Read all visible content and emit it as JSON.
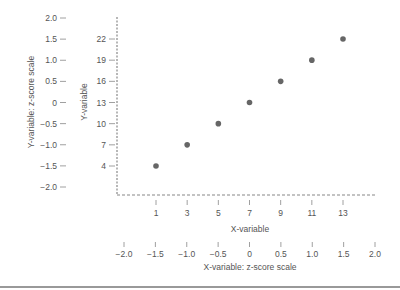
{
  "chart_data": {
    "type": "scatter",
    "title": "",
    "xlabel": "X-variable",
    "ylabel": "Y-variable",
    "secondary_xlabel": "X-variable: z-score scale",
    "secondary_ylabel": "Y-variable: z-score scale",
    "x": [
      1,
      3,
      5,
      7,
      9,
      11,
      13
    ],
    "y": [
      4,
      7,
      10,
      13,
      16,
      19,
      22
    ],
    "x_ticks": [
      "1",
      "3",
      "5",
      "7",
      "9",
      "11",
      "13"
    ],
    "y_ticks": [
      "4",
      "7",
      "10",
      "13",
      "16",
      "19",
      "22"
    ],
    "x_z_ticks": [
      "−2.0",
      "−1.5",
      "−1.0",
      "−0.5",
      "0",
      "0.5",
      "1.0",
      "1.5",
      "2.0"
    ],
    "y_z_ticks": [
      "2.0",
      "1.5",
      "1.0",
      "0.5",
      "0",
      "−0.5",
      "−1.0",
      "−1.5",
      "−2.0"
    ],
    "grid": false,
    "legend": null,
    "colors": {
      "points": "#666666",
      "axes": "#888888",
      "text": "#555555"
    }
  }
}
